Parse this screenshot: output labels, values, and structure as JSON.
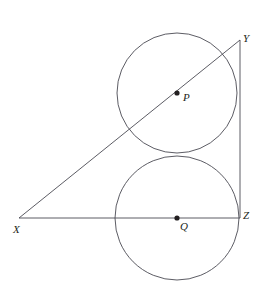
{
  "figure": {
    "canvas": {
      "width": 258,
      "height": 302,
      "background": "#ffffff"
    },
    "stroke_color": "#4a4a52",
    "dot_color": "#231f20",
    "label_color": "#231f20",
    "stroke_width": 0.9,
    "vertices": [
      {
        "name": "X",
        "label": "X",
        "x": 19,
        "y": 218
      },
      {
        "name": "Y",
        "label": "Y",
        "x": 240,
        "y": 40
      },
      {
        "name": "Z",
        "label": "Z",
        "x": 240,
        "y": 218
      }
    ],
    "segments": [
      {
        "name": "segment-XZ",
        "from": "X",
        "to": "Z",
        "x1": 19,
        "y1": 218,
        "x2": 240,
        "y2": 218
      },
      {
        "name": "segment-XY",
        "from": "X",
        "to": "Y",
        "x1": 19,
        "y1": 218,
        "x2": 240,
        "y2": 40
      },
      {
        "name": "segment-YZ",
        "from": "Y",
        "to": "Z",
        "x1": 240,
        "y1": 40,
        "x2": 240,
        "y2": 218
      }
    ],
    "circles": [
      {
        "name": "circle-P",
        "label": "P",
        "cx": 177,
        "cy": 93,
        "r": 60
      },
      {
        "name": "circle-Q",
        "label": "Q",
        "cx": 177,
        "cy": 218,
        "r": 62
      }
    ],
    "centers": [
      {
        "name": "P",
        "label": "P",
        "cx": 177,
        "cy": 93,
        "dot_r": 2.6
      },
      {
        "name": "Q",
        "label": "Q",
        "cx": 177,
        "cy": 218,
        "dot_r": 2.6
      }
    ]
  }
}
